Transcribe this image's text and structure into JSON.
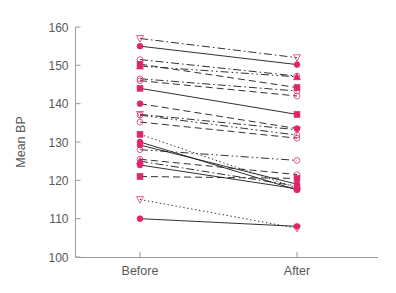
{
  "chart_data": {
    "type": "line",
    "title": "",
    "xlabel": "",
    "ylabel": "Mean BP",
    "categories": [
      "Before",
      "After"
    ],
    "ylim": [
      100,
      160
    ],
    "yticks": [
      100,
      110,
      120,
      130,
      140,
      150,
      160
    ],
    "ytick_labels": [
      "100",
      "110",
      "120",
      "130",
      "140",
      "150",
      "160"
    ],
    "grid": false,
    "legend": "none",
    "marker_color": "#e0246a",
    "line_color": "#1a1a1a",
    "series": [
      {
        "name": "subject-01",
        "values": [
          157.0,
          152.0
        ],
        "marker": "triangle-down-open",
        "linestyle": "dashdot"
      },
      {
        "name": "subject-02",
        "values": [
          155.0,
          150.2
        ],
        "marker": "circle-filled",
        "linestyle": "solid"
      },
      {
        "name": "subject-03",
        "values": [
          151.5,
          147.2
        ],
        "marker": "circle-open",
        "linestyle": "dashdot"
      },
      {
        "name": "subject-04",
        "values": [
          150.3,
          144.2
        ],
        "marker": "square-filled",
        "linestyle": "dashed"
      },
      {
        "name": "subject-05",
        "values": [
          149.8,
          147.0
        ],
        "marker": "triangle-up-filled",
        "linestyle": "dashdotdot"
      },
      {
        "name": "subject-06",
        "values": [
          146.5,
          143.3
        ],
        "marker": "circle-open",
        "linestyle": "dashdot"
      },
      {
        "name": "subject-07",
        "values": [
          146.0,
          142.0
        ],
        "marker": "circle-open",
        "linestyle": "dashed"
      },
      {
        "name": "subject-08",
        "values": [
          144.0,
          137.2
        ],
        "marker": "square-filled",
        "linestyle": "solid"
      },
      {
        "name": "subject-09",
        "values": [
          140.0,
          133.5
        ],
        "marker": "circle-filled",
        "linestyle": "dashed"
      },
      {
        "name": "subject-10",
        "values": [
          137.2,
          133.2
        ],
        "marker": "triangle-down-open",
        "linestyle": "dashdot"
      },
      {
        "name": "subject-11",
        "values": [
          137.0,
          131.8
        ],
        "marker": "circle-open",
        "linestyle": "dashdotdot"
      },
      {
        "name": "subject-12",
        "values": [
          135.2,
          131.0
        ],
        "marker": "circle-open",
        "linestyle": "dashed"
      },
      {
        "name": "subject-13",
        "values": [
          132.0,
          118.0
        ],
        "marker": "square-filled",
        "linestyle": "dotted"
      },
      {
        "name": "subject-14",
        "values": [
          130.0,
          117.5
        ],
        "marker": "circle-filled",
        "linestyle": "solid"
      },
      {
        "name": "subject-15",
        "values": [
          129.2,
          119.0
        ],
        "marker": "circle-filled",
        "linestyle": "solid"
      },
      {
        "name": "subject-16",
        "values": [
          128.0,
          125.2
        ],
        "marker": "circle-open",
        "linestyle": "dashdotdot"
      },
      {
        "name": "subject-17",
        "values": [
          125.5,
          121.5
        ],
        "marker": "circle-open",
        "linestyle": "dashed"
      },
      {
        "name": "subject-18",
        "values": [
          125.0,
          118.5
        ],
        "marker": "triangle-up-filled",
        "linestyle": "dashdot"
      },
      {
        "name": "subject-19",
        "values": [
          124.0,
          117.8
        ],
        "marker": "circle-filled",
        "linestyle": "solid"
      },
      {
        "name": "subject-20",
        "values": [
          121.0,
          120.5
        ],
        "marker": "square-filled",
        "linestyle": "dashed"
      },
      {
        "name": "subject-21",
        "values": [
          115.0,
          107.5
        ],
        "marker": "triangle-down-open",
        "linestyle": "dotted"
      },
      {
        "name": "subject-22",
        "values": [
          110.0,
          108.0
        ],
        "marker": "circle-filled",
        "linestyle": "solid"
      }
    ]
  }
}
